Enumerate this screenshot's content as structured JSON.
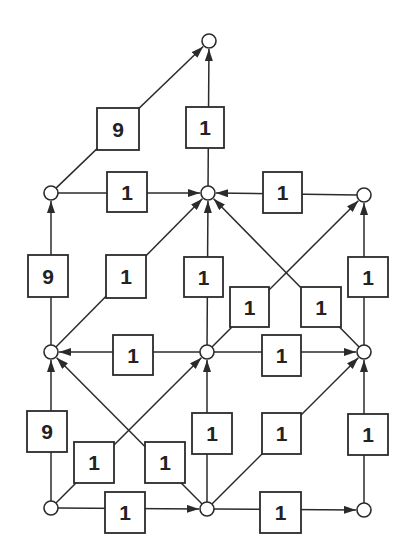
{
  "diagram": {
    "type": "directed-weighted-graph",
    "colors": {
      "stroke": "#2b2b2b",
      "background": "#ffffff",
      "text": "#222222"
    },
    "nodes": [
      {
        "id": "top",
        "x": 209,
        "y": 41
      },
      {
        "id": "r1c0",
        "x": 51,
        "y": 193
      },
      {
        "id": "r1c1",
        "x": 208,
        "y": 193
      },
      {
        "id": "r1c2",
        "x": 364,
        "y": 195
      },
      {
        "id": "r2c0",
        "x": 51,
        "y": 352
      },
      {
        "id": "r2c1",
        "x": 207,
        "y": 352
      },
      {
        "id": "r2c2",
        "x": 364,
        "y": 352
      },
      {
        "id": "r3c0",
        "x": 51,
        "y": 508
      },
      {
        "id": "r3c1",
        "x": 207,
        "y": 509
      },
      {
        "id": "r3c2",
        "x": 364,
        "y": 510
      }
    ],
    "edges": [
      {
        "from": "r1c0",
        "to": "top",
        "weight": "9",
        "box": [
          97,
          108,
          42,
          42
        ]
      },
      {
        "from": "r1c1",
        "to": "top",
        "weight": "1",
        "box": [
          186,
          107,
          38,
          41
        ]
      },
      {
        "from": "r1c0",
        "to": "r1c1",
        "weight": "1",
        "box": [
          107,
          172,
          40,
          40
        ]
      },
      {
        "from": "r1c2",
        "to": "r1c1",
        "weight": "1",
        "box": [
          263,
          172,
          39,
          41
        ]
      },
      {
        "from": "r2c0",
        "to": "r1c0",
        "weight": "9",
        "box": [
          28,
          255,
          40,
          42
        ]
      },
      {
        "from": "r2c0",
        "to": "r1c1",
        "weight": "1",
        "box": [
          106,
          255,
          40,
          43
        ]
      },
      {
        "from": "r2c1",
        "to": "r1c1",
        "weight": "1",
        "box": [
          184,
          257,
          39,
          40
        ]
      },
      {
        "from": "r2c1",
        "to": "r1c2",
        "weight": "1",
        "box": [
          230,
          287,
          39,
          40
        ]
      },
      {
        "from": "r2c2",
        "to": "r1c1",
        "weight": "1",
        "box": [
          301,
          287,
          40,
          40
        ]
      },
      {
        "from": "r2c2",
        "to": "r1c2",
        "weight": "1",
        "box": [
          348,
          257,
          40,
          40
        ]
      },
      {
        "from": "r2c1",
        "to": "r2c0",
        "weight": "1",
        "box": [
          113,
          335,
          40,
          40
        ]
      },
      {
        "from": "r2c1",
        "to": "r2c2",
        "weight": "1",
        "box": [
          262,
          335,
          39,
          41
        ]
      },
      {
        "from": "r3c0",
        "to": "r2c0",
        "weight": "9",
        "box": [
          27,
          411,
          40,
          41
        ]
      },
      {
        "from": "r3c0",
        "to": "r2c1",
        "weight": "1",
        "box": [
          74,
          442,
          40,
          41
        ]
      },
      {
        "from": "r3c1",
        "to": "r2c0",
        "weight": "1",
        "box": [
          145,
          442,
          40,
          41
        ]
      },
      {
        "from": "r3c1",
        "to": "r2c1",
        "weight": "1",
        "box": [
          192,
          413,
          40,
          41
        ]
      },
      {
        "from": "r3c1",
        "to": "r2c2",
        "weight": "1",
        "box": [
          262,
          413,
          39,
          41
        ]
      },
      {
        "from": "r3c2",
        "to": "r2c2",
        "weight": "1",
        "box": [
          348,
          414,
          40,
          41
        ]
      },
      {
        "from": "r3c0",
        "to": "r3c1",
        "weight": "1",
        "box": [
          105,
          492,
          40,
          41
        ]
      },
      {
        "from": "r3c1",
        "to": "r3c2",
        "weight": "1",
        "box": [
          260,
          492,
          41,
          41
        ]
      }
    ]
  }
}
